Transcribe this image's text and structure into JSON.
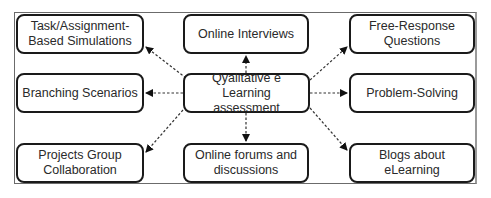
{
  "diagram": {
    "center": {
      "id": "center",
      "label": "Qyalitative e Learning assessment"
    },
    "nodes": [
      {
        "id": "task",
        "label": "Task/Assignment-Based Simulations",
        "line1": "Task/Assignment-",
        "line2": "Based Simulations"
      },
      {
        "id": "interviews",
        "label": "Online Interviews"
      },
      {
        "id": "free",
        "label": "Free-Response Questions",
        "line1": "Free-Response",
        "line2": "Questions"
      },
      {
        "id": "branching",
        "label": "Branching Scenarios"
      },
      {
        "id": "problem",
        "label": "Problem-Solving"
      },
      {
        "id": "projects",
        "label": "Projects Group Collaboration",
        "line1": "Projects Group",
        "line2": "Collaboration"
      },
      {
        "id": "forums",
        "label": "Online forums and discussions",
        "line1": "Online forums and",
        "line2": "discussions"
      },
      {
        "id": "blogs",
        "label": "Blogs about eLearning"
      }
    ],
    "center_lines": {
      "line1": "Qyalitative e Learning",
      "line2": "assessment"
    },
    "edges": [
      {
        "from": "center",
        "to": "task",
        "style": "dashed-arrow"
      },
      {
        "from": "center",
        "to": "interviews",
        "style": "dashed-arrow"
      },
      {
        "from": "center",
        "to": "free",
        "style": "dashed-arrow"
      },
      {
        "from": "center",
        "to": "branching",
        "style": "dashed-arrow"
      },
      {
        "from": "center",
        "to": "problem",
        "style": "dashed-arrow"
      },
      {
        "from": "center",
        "to": "projects",
        "style": "dashed-arrow"
      },
      {
        "from": "center",
        "to": "forums",
        "style": "dashed-arrow"
      },
      {
        "from": "center",
        "to": "blogs",
        "style": "dashed-arrow"
      }
    ]
  }
}
